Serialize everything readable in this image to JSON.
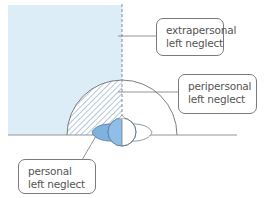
{
  "diagram": {
    "type": "spatial neglect regions",
    "colors": {
      "extrapersonal_fill": "#dcedf7",
      "head_fill": "#8fbfe8",
      "neck_fill": "#7fb2e0",
      "line": "#7a7a7a",
      "hatch": "#6b8fb0"
    },
    "labels": {
      "extrapersonal": {
        "line1": "extrapersonal",
        "line2": "left neglect"
      },
      "peripersonal": {
        "line1": "peripersonal",
        "line2": "left neglect"
      },
      "personal": {
        "line1": "personal",
        "line2": "left neglect"
      }
    }
  }
}
